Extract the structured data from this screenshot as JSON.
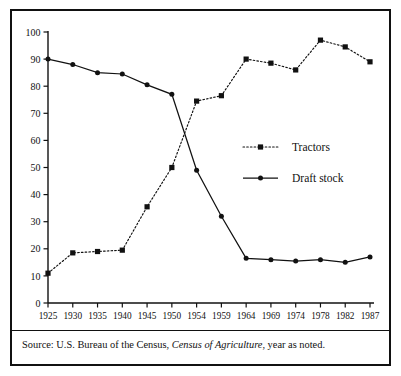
{
  "caption": {
    "prefix": "Source: U.S. Bureau of the Census, ",
    "italic": "Census of Agriculture",
    "suffix": ", year as noted."
  },
  "legend": {
    "position": "inside-right",
    "entries": [
      {
        "label": "Tractors",
        "marker": "square",
        "line": "dotted",
        "color": "#111111"
      },
      {
        "label": "Draft stock",
        "marker": "circle",
        "line": "solid",
        "color": "#111111"
      }
    ]
  },
  "chart_data": {
    "type": "line",
    "title": "",
    "subtitle": "",
    "xlabel": "",
    "ylabel": "",
    "grid": false,
    "legend_position": "inside-right",
    "categories": [
      "1925",
      "1930",
      "1935",
      "1940",
      "1945",
      "1950",
      "1954",
      "1959",
      "1964",
      "1969",
      "1974",
      "1978",
      "1982",
      "1987"
    ],
    "x": [
      1925,
      1930,
      1935,
      1940,
      1945,
      1950,
      1954,
      1959,
      1964,
      1969,
      1974,
      1978,
      1982,
      1987
    ],
    "ylim": [
      0,
      100
    ],
    "yticks": [
      0,
      10,
      20,
      30,
      40,
      50,
      60,
      70,
      80,
      90,
      100
    ],
    "ytick_labels": [
      "0",
      "10",
      "20",
      "30",
      "40",
      "50",
      "60",
      "70",
      "80",
      "90",
      "100"
    ],
    "series": [
      {
        "name": "Tractors",
        "line": "dotted",
        "marker": "square",
        "color": "#111111",
        "values": [
          11,
          18.5,
          19,
          19.5,
          35.5,
          50,
          74.5,
          76.5,
          90,
          88.5,
          86,
          97,
          94.5,
          89
        ]
      },
      {
        "name": "Draft stock",
        "line": "solid",
        "marker": "circle",
        "color": "#111111",
        "values": [
          90,
          88,
          85,
          84.5,
          80.5,
          77,
          49,
          32,
          16.5,
          16,
          15.5,
          16,
          15,
          17
        ]
      }
    ]
  }
}
